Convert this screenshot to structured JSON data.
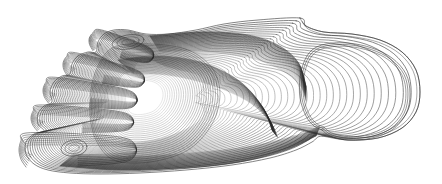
{
  "figure": {
    "orientation": "toes at left, heel at right",
    "width": 442,
    "height": 184,
    "background_color": "#ffffff",
    "line_color": "#2b2b2b",
    "line_width": 0.65,
    "has_text_labels": false,
    "has_axes": false,
    "has_legend": false
  },
  "chart_data": {
    "type": "line",
    "subtitle": "",
    "xlabel": "",
    "ylabel": "",
    "xlim": [
      0,
      442
    ],
    "ylim": [
      0,
      184
    ],
    "grid": false,
    "legend_position": "none",
    "rendering": "nested iso-elevation contour outlines, no fill",
    "stroke_color": "#2b2b2b",
    "stroke_width": 0.65,
    "annotations": [],
    "regions": [
      {
        "name": "heel",
        "description": "large open rounded lobe at right, blank interior, bounded by few sparse outer contours",
        "center": [
          352,
          92
        ],
        "contour_count": 3,
        "density": "sparse"
      },
      {
        "name": "midfoot-arch",
        "description": "dense roughly parallel contours sweeping diagonally across the middle",
        "center": [
          195,
          92
        ],
        "contour_count": 30,
        "density": "dense"
      },
      {
        "name": "forefoot-ball",
        "description": "broad rounded contour family behind the toes",
        "center": [
          140,
          95
        ],
        "contour_count": 26,
        "density": "medium"
      },
      {
        "name": "toe-1-hallux",
        "description": "big toe at lower left with small closed inner peak contour",
        "center": [
          78,
          147
        ],
        "contour_count": 11,
        "density": "medium"
      },
      {
        "name": "toe-2",
        "description": "second toe lobe",
        "center": [
          70,
          117
        ],
        "contour_count": 9,
        "density": "medium"
      },
      {
        "name": "toe-3",
        "description": "third toe lobe",
        "center": [
          74,
          90
        ],
        "contour_count": 9,
        "density": "medium"
      },
      {
        "name": "toe-4",
        "description": "fourth toe lobe",
        "center": [
          85,
          66
        ],
        "contour_count": 8,
        "density": "medium"
      },
      {
        "name": "toe-5-little",
        "description": "smallest toe lobe at upper left",
        "center": [
          100,
          48
        ],
        "contour_count": 7,
        "density": "medium"
      },
      {
        "name": "upper-arch-convergence",
        "description": "very dense contour convergence where arch meets heel along upper right boundary",
        "center": [
          290,
          52
        ],
        "contour_count": 34,
        "density": "very-dense"
      },
      {
        "name": "lower-edge-convergence",
        "description": "dense contour packing along the lower lateral boundary",
        "center": [
          250,
          160
        ],
        "contour_count": 30,
        "density": "very-dense"
      },
      {
        "name": "upper-peak-loop",
        "description": "small closed loop contour near top of forefoot",
        "center": [
          128,
          42
        ],
        "contour_count": 2,
        "density": "sparse"
      }
    ],
    "series": [
      {
        "name": "outer-silhouette",
        "level": 0,
        "values": [
          0
        ]
      },
      {
        "name": "contour-levels",
        "description": "successive iso-elevation rings nested inward from the foot outline",
        "values": [
          0,
          1,
          2,
          3,
          4,
          5,
          6,
          7,
          8,
          9,
          10,
          11,
          12,
          13,
          14,
          15,
          16,
          17,
          18,
          19,
          20,
          21,
          22,
          23,
          24,
          25,
          26,
          27,
          28,
          29,
          30,
          31,
          32,
          33,
          34,
          35
        ]
      }
    ],
    "geometry": {
      "outline": [
        [
          300,
          18
        ],
        [
          258,
          20
        ],
        [
          224,
          24
        ],
        [
          196,
          30
        ],
        [
          168,
          34
        ],
        [
          146,
          34
        ],
        [
          128,
          30
        ],
        [
          114,
          30
        ],
        [
          104,
          34
        ],
        [
          98,
          42
        ],
        [
          96,
          52
        ],
        [
          88,
          52
        ],
        [
          78,
          56
        ],
        [
          72,
          64
        ],
        [
          70,
          74
        ],
        [
          62,
          76
        ],
        [
          54,
          82
        ],
        [
          50,
          92
        ],
        [
          52,
          102
        ],
        [
          44,
          106
        ],
        [
          38,
          114
        ],
        [
          38,
          124
        ],
        [
          44,
          131
        ],
        [
          34,
          134
        ],
        [
          26,
          142
        ],
        [
          26,
          154
        ],
        [
          34,
          164
        ],
        [
          48,
          170
        ],
        [
          70,
          173
        ],
        [
          100,
          174
        ],
        [
          140,
          173
        ],
        [
          186,
          170
        ],
        [
          232,
          165
        ],
        [
          270,
          158
        ],
        [
          296,
          150
        ],
        [
          312,
          142
        ],
        [
          322,
          136
        ],
        [
          348,
          140
        ],
        [
          378,
          138
        ],
        [
          402,
          128
        ],
        [
          416,
          112
        ],
        [
          420,
          92
        ],
        [
          416,
          70
        ],
        [
          402,
          52
        ],
        [
          380,
          40
        ],
        [
          352,
          34
        ],
        [
          324,
          32
        ],
        [
          306,
          26
        ]
      ],
      "heel_inner": [
        [
          322,
          130
        ],
        [
          330,
          136
        ],
        [
          348,
          140
        ],
        [
          372,
          138
        ],
        [
          392,
          130
        ],
        [
          406,
          114
        ],
        [
          410,
          94
        ],
        [
          406,
          74
        ],
        [
          392,
          58
        ],
        [
          372,
          48
        ],
        [
          348,
          43
        ],
        [
          326,
          44
        ],
        [
          312,
          50
        ],
        [
          304,
          62
        ],
        [
          300,
          78
        ],
        [
          300,
          98
        ],
        [
          306,
          116
        ],
        [
          314,
          126
        ]
      ],
      "toe_lobes": [
        {
          "id": "toe5",
          "tip": [
            96,
            40
          ],
          "base": [
            150,
            56
          ],
          "width": 22
        },
        {
          "id": "toe4",
          "tip": [
            70,
            64
          ],
          "base": [
            140,
            80
          ],
          "width": 24
        },
        {
          "id": "toe3",
          "tip": [
            50,
            90
          ],
          "base": [
            132,
            100
          ],
          "width": 26
        },
        {
          "id": "toe2",
          "tip": [
            38,
            118
          ],
          "base": [
            128,
            122
          ],
          "width": 26
        },
        {
          "id": "toe1",
          "tip": [
            26,
            150
          ],
          "base": [
            130,
            150
          ],
          "width": 34
        }
      ],
      "peak_loops": [
        {
          "id": "hallux-peak",
          "center": [
            74,
            148
          ],
          "rx": 13,
          "ry": 8,
          "rotation": -8
        },
        {
          "id": "forefoot-peak",
          "center": [
            128,
            42
          ],
          "rx": 16,
          "ry": 7,
          "rotation": -10
        }
      ]
    }
  }
}
